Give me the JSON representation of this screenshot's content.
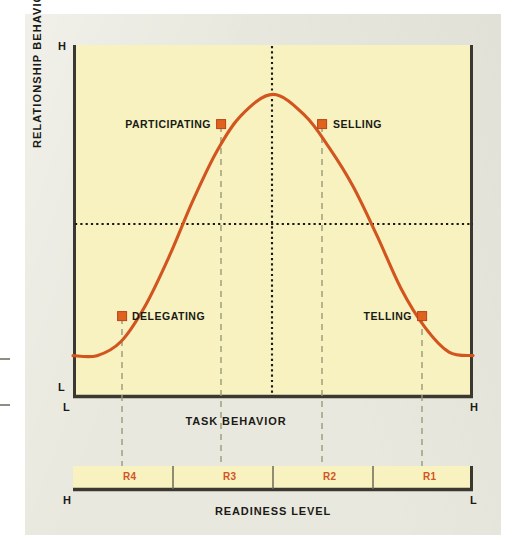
{
  "figure": {
    "background_color": "#e9e8de",
    "plot_background_color": "#f7f2bf",
    "curve_color": "#d2541f",
    "axis_color": "#3a3830",
    "accent_color": "#d2541f",
    "text_color": "#1a1a16"
  },
  "axes": {
    "y_title": "RELATIONSHIP BEHAVIOR",
    "y_high_label": "H",
    "y_low_label": "L",
    "x_title": "TASK BEHAVIOR",
    "x_low_label": "L",
    "x_high_label": "H"
  },
  "readiness": {
    "title": "READINESS LEVEL",
    "left_label": "H",
    "right_label": "L",
    "segments": [
      {
        "label": "R4"
      },
      {
        "label": "R3"
      },
      {
        "label": "R2"
      },
      {
        "label": "R1"
      }
    ]
  },
  "styles": [
    {
      "label": "DELEGATING"
    },
    {
      "label": "PARTICIPATING"
    },
    {
      "label": "SELLING"
    },
    {
      "label": "TELLING"
    }
  ],
  "chart_data": {
    "type": "line",
    "title": "",
    "subtitle": "",
    "xlabel": "TASK BEHAVIOR",
    "ylabel": "RELATIONSHIP BEHAVIOR",
    "xlim": [
      0,
      100
    ],
    "ylim": [
      0,
      100
    ],
    "x_tick_labels": [
      "L",
      "H"
    ],
    "y_tick_labels": [
      "L",
      "H"
    ],
    "grid": false,
    "reference_lines": [
      {
        "orientation": "vertical",
        "x": 50,
        "style": "dotted"
      },
      {
        "orientation": "horizontal",
        "y": 49,
        "style": "dotted"
      }
    ],
    "series": [
      {
        "name": "Leadership style bell curve",
        "style": "solid",
        "color": "#d2541f",
        "x": [
          0,
          6,
          12,
          18,
          24,
          30,
          36,
          42,
          50,
          58,
          64,
          70,
          76,
          82,
          88,
          94,
          100
        ],
        "y": [
          12,
          12,
          16,
          26,
          40,
          56,
          70,
          80,
          86,
          80,
          71,
          60,
          46,
          31,
          20,
          13,
          12
        ]
      }
    ],
    "annotations": [
      {
        "label": "DELEGATING",
        "x": 12.3,
        "y": 23.3,
        "marker": "square",
        "label_side": "right",
        "readiness": "R4"
      },
      {
        "label": "PARTICIPATING",
        "x": 37.0,
        "y": 77.6,
        "marker": "square",
        "label_side": "left",
        "readiness": "R3"
      },
      {
        "label": "SELLING",
        "x": 62.3,
        "y": 77.6,
        "marker": "square",
        "label_side": "right",
        "readiness": "R2"
      },
      {
        "label": "TELLING",
        "x": 87.3,
        "y": 23.3,
        "marker": "square",
        "label_side": "left",
        "readiness": "R1"
      }
    ],
    "readiness_axis": {
      "label": "READINESS LEVEL",
      "direction_left": "H",
      "direction_right": "L",
      "segments": [
        "R4",
        "R3",
        "R2",
        "R1"
      ]
    }
  }
}
